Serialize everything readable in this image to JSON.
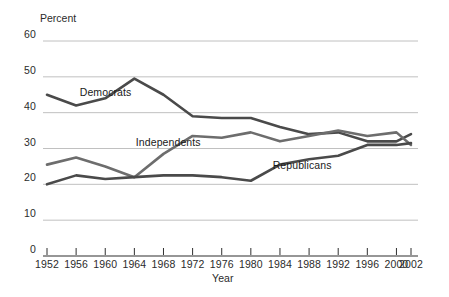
{
  "chart_data": {
    "type": "line",
    "title": "",
    "xlabel": "Year",
    "ylabel": "Percent",
    "ylim": [
      0,
      60
    ],
    "xlim": [
      1952,
      2002
    ],
    "grid": true,
    "legend_position": "inline-annotations",
    "y_ticks": [
      "0",
      "10",
      "20",
      "30",
      "40",
      "50",
      "60"
    ],
    "y_tick_values": [
      0,
      10,
      20,
      30,
      40,
      50,
      60
    ],
    "x_ticks": [
      "1952",
      "1956",
      "1960",
      "1964",
      "1968",
      "1972",
      "1976",
      "1980",
      "1984",
      "1988",
      "1992",
      "1996",
      "2000",
      "2002"
    ],
    "x_tick_values": [
      1952,
      1956,
      1960,
      1964,
      1968,
      1972,
      1976,
      1980,
      1984,
      1988,
      1992,
      1996,
      2000,
      2002
    ],
    "x": [
      1952,
      1956,
      1960,
      1964,
      1968,
      1972,
      1976,
      1980,
      1984,
      1988,
      1992,
      1996,
      2000,
      2002
    ],
    "series": [
      {
        "name": "Democrats",
        "label": "Democrats",
        "color": "#4a4a4a",
        "values": [
          45,
          42,
          44,
          49.5,
          45,
          39,
          38.5,
          38.5,
          36,
          34,
          34.5,
          32,
          32,
          34
        ]
      },
      {
        "name": "Independents",
        "label": "Independents",
        "color": "#6d6d6d",
        "values": [
          25.5,
          27.5,
          25,
          22,
          28.5,
          33.5,
          33,
          34.5,
          32,
          33.5,
          35,
          33.5,
          34.5,
          31
        ]
      },
      {
        "name": "Republicans",
        "label": "Republicans",
        "color": "#4a4a4a",
        "values": [
          20,
          22.5,
          21.5,
          22,
          22.5,
          22.5,
          22,
          21,
          25.5,
          27,
          28,
          31,
          31,
          31.5
        ]
      }
    ],
    "annotations": [
      {
        "text": "Democrats",
        "x": 1956.5,
        "y": 45.5
      },
      {
        "text": "Independents",
        "x": 1964.2,
        "y": 31.6
      },
      {
        "text": "Republicans",
        "x": 1983.0,
        "y": 25.0
      }
    ],
    "colors": {
      "gridline": "#b9b9b9",
      "axis": "#2f2f2f",
      "background": "#ffffff",
      "line_dark": "#4a4a4a",
      "line_mid": "#6d6d6d"
    }
  },
  "axes": {
    "y_axis_title": "Percent",
    "x_axis_title": "Year"
  }
}
